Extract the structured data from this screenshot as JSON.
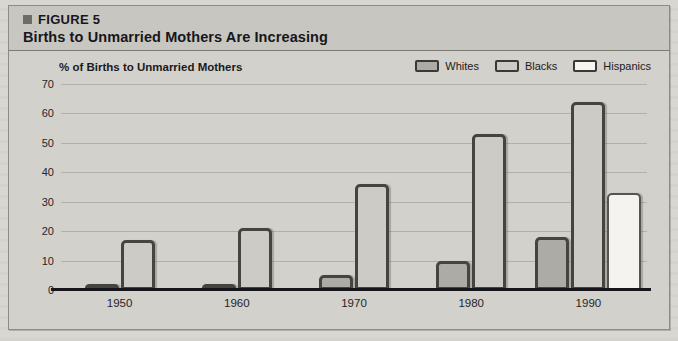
{
  "figure": {
    "number_label": "FIGURE 5",
    "title": "Births to Unmarried Mothers Are Increasing",
    "marker_icon": "square-bullet-icon"
  },
  "legend": {
    "items": [
      {
        "label": "Whites",
        "color": "#adaba5",
        "swatch_icon": "legend-swatch-icon"
      },
      {
        "label": "Blacks",
        "color": "#cdcbc5",
        "swatch_icon": "legend-swatch-icon"
      },
      {
        "label": "Hispanics",
        "color": "#f4f3ef",
        "swatch_icon": "legend-swatch-icon"
      }
    ]
  },
  "axis": {
    "y_title": "% of Births to Unmarried Mothers",
    "y_ticks": [
      "70",
      "60",
      "50",
      "40",
      "30",
      "20",
      "10",
      "0"
    ],
    "x_ticks": [
      "1950",
      "1960",
      "1970",
      "1980",
      "1990"
    ]
  },
  "chart_data": {
    "type": "bar",
    "title": "Births to Unmarried Mothers Are Increasing",
    "subtitle": "FIGURE 5",
    "xlabel": "",
    "ylabel": "% of Births to Unmarried Mothers",
    "ylim": [
      0,
      70
    ],
    "ytick_step": 10,
    "grid": true,
    "legend_position": "top-right",
    "categories": [
      "1950",
      "1960",
      "1970",
      "1980",
      "1990"
    ],
    "series": [
      {
        "name": "Whites",
        "color": "#adaba5",
        "values": [
          2,
          2,
          5,
          10,
          18
        ]
      },
      {
        "name": "Blacks",
        "color": "#cdcbc5",
        "values": [
          17,
          21,
          36,
          53,
          64
        ]
      },
      {
        "name": "Hispanics",
        "color": "#f4f3ef",
        "values": [
          null,
          null,
          null,
          null,
          33
        ]
      }
    ]
  }
}
